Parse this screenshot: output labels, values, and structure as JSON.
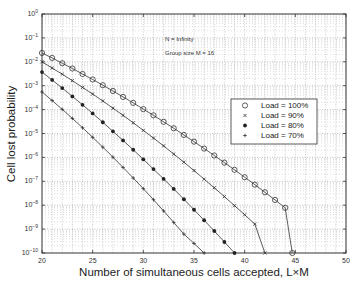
{
  "chart_data": {
    "type": "line",
    "title": "",
    "xlabel": "Number of simultaneous cells accepted, L×M",
    "ylabel": "Cell lost probability",
    "xlim": [
      20,
      50
    ],
    "ylim": [
      1e-10,
      1
    ],
    "yscale": "log",
    "grid": true,
    "x_ticks": [
      "20",
      "25",
      "30",
      "35",
      "40",
      "45",
      "50"
    ],
    "y_ticks": [
      "10^0",
      "10^-1",
      "10^-2",
      "10^-3",
      "10^-4",
      "10^-5",
      "10^-6",
      "10^-7",
      "10^-8",
      "10^-9",
      "10^-10"
    ],
    "annotations": [
      "N = Infinity",
      "Group size M = 16"
    ],
    "legend_position": "inside right",
    "series": [
      {
        "name": "Load = 100%",
        "marker": "o",
        "x": [
          20,
          21,
          22,
          23,
          24,
          25,
          26,
          27,
          28,
          29,
          30,
          31,
          32,
          33,
          34,
          35,
          36,
          37,
          38,
          39,
          40,
          41,
          42,
          43,
          44,
          44.7
        ],
        "log10_y": [
          -1.63,
          -1.84,
          -2.06,
          -2.28,
          -2.51,
          -2.74,
          -2.98,
          -3.22,
          -3.47,
          -3.72,
          -3.98,
          -4.24,
          -4.51,
          -4.78,
          -5.06,
          -5.34,
          -5.63,
          -5.92,
          -6.22,
          -6.52,
          -6.83,
          -7.14,
          -7.46,
          -7.78,
          -8.11,
          -10
        ]
      },
      {
        "name": "Load = 90%",
        "marker": "x",
        "x": [
          20,
          21,
          22,
          23,
          24,
          25,
          26,
          27,
          28,
          29,
          30,
          31,
          32,
          33,
          34,
          35,
          36,
          37,
          38,
          39,
          40,
          41,
          42
        ],
        "log10_y": [
          -2.0,
          -2.26,
          -2.52,
          -2.79,
          -3.07,
          -3.35,
          -3.64,
          -3.94,
          -4.24,
          -4.55,
          -4.87,
          -5.19,
          -5.52,
          -5.86,
          -6.2,
          -6.55,
          -6.91,
          -7.27,
          -7.64,
          -8.02,
          -8.4,
          -8.79,
          -10
        ]
      },
      {
        "name": "Load = 80%",
        "marker": "*",
        "x": [
          20,
          21,
          22,
          23,
          24,
          25,
          26,
          27,
          28,
          29,
          30,
          31,
          32,
          33,
          34,
          35,
          36,
          37,
          38,
          39
        ],
        "log10_y": [
          -2.43,
          -2.76,
          -3.1,
          -3.45,
          -3.8,
          -4.16,
          -4.53,
          -4.91,
          -5.29,
          -5.68,
          -6.08,
          -6.49,
          -6.9,
          -7.32,
          -7.75,
          -8.19,
          -8.63,
          -9.08,
          -9.54,
          -10
        ]
      },
      {
        "name": "Load = 70%",
        "marker": "+",
        "x": [
          20,
          21,
          22,
          23,
          24,
          25,
          26,
          27,
          28,
          29,
          30,
          31,
          32,
          33,
          34,
          35,
          36
        ],
        "log10_y": [
          -3.26,
          -3.62,
          -3.99,
          -4.37,
          -4.76,
          -5.16,
          -5.57,
          -5.99,
          -6.42,
          -6.86,
          -7.31,
          -7.77,
          -8.24,
          -8.72,
          -9.21,
          -9.6,
          -10
        ]
      }
    ]
  }
}
